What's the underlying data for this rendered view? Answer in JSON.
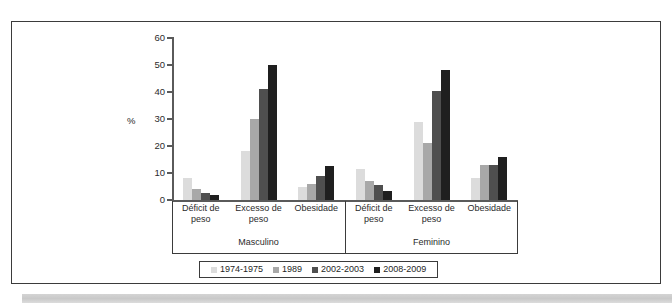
{
  "chart_data": {
    "type": "bar",
    "title": "",
    "xlabel": "",
    "ylabel": "%",
    "ylim": [
      0,
      60
    ],
    "yticks": [
      0,
      10,
      20,
      30,
      40,
      50,
      60
    ],
    "grid": false,
    "legend_position": "bottom",
    "group_labels": [
      "Masculino",
      "Feminino"
    ],
    "categories": [
      "Déficit de peso",
      "Excesso de peso",
      "Obesidade",
      "Déficit de peso",
      "Excesso de peso",
      "Obesidade"
    ],
    "category_lines": [
      [
        "Déficit de",
        "peso"
      ],
      [
        "Excesso de",
        "peso"
      ],
      [
        "Obesidade",
        ""
      ],
      [
        "Déficit de",
        "peso"
      ],
      [
        "Excesso de",
        "peso"
      ],
      [
        "Obesidade",
        ""
      ]
    ],
    "series": [
      {
        "name": "1974-1975",
        "color": "#dcdcdc",
        "values": [
          8.0,
          18.0,
          5.0,
          11.5,
          29.0,
          8.0
        ]
      },
      {
        "name": "1989",
        "color": "#a8a8a8",
        "values": [
          4.0,
          30.0,
          6.0,
          7.0,
          21.0,
          13.0
        ]
      },
      {
        "name": "2002-2003",
        "color": "#4f4f4f",
        "values": [
          2.5,
          41.0,
          9.0,
          5.5,
          40.5,
          13.0
        ]
      },
      {
        "name": "2008-2009",
        "color": "#1f1f1f",
        "values": [
          1.8,
          50.0,
          12.5,
          3.5,
          48.0,
          16.0
        ]
      }
    ]
  },
  "axis": {
    "unit_label": "%",
    "tick_labels": [
      "60",
      "50",
      "40",
      "30",
      "20",
      "10",
      "0"
    ]
  },
  "legend": {
    "items": [
      {
        "label": "1974-1975",
        "color": "#dcdcdc"
      },
      {
        "label": "1989",
        "color": "#a8a8a8"
      },
      {
        "label": "2002-2003",
        "color": "#4f4f4f"
      },
      {
        "label": "2008-2009",
        "color": "#1f1f1f"
      }
    ]
  }
}
